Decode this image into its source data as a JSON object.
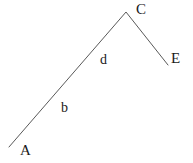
{
  "figure": {
    "background_color": "#ffffff",
    "stroke_color": "#595959",
    "text_color": "#1a1a1a",
    "stroke_width": 1,
    "vertices": [
      {
        "id": "A",
        "label": "A",
        "x": 9,
        "y": 147
      },
      {
        "id": "C",
        "label": "C",
        "x": 126,
        "y": 12
      },
      {
        "id": "E",
        "label": "E",
        "x": 168,
        "y": 65
      }
    ],
    "segments": [
      {
        "id": "AC",
        "label": "b",
        "from": "A",
        "to": "C"
      },
      {
        "id": "CE",
        "label": "d",
        "from": "C",
        "to": "E"
      }
    ],
    "labels": {
      "vertex_A": "A",
      "vertex_C": "C",
      "vertex_E": "E",
      "segment_lower": "b",
      "segment_upper": "d"
    },
    "polyline_points": "9,147 126,12 168,65"
  }
}
